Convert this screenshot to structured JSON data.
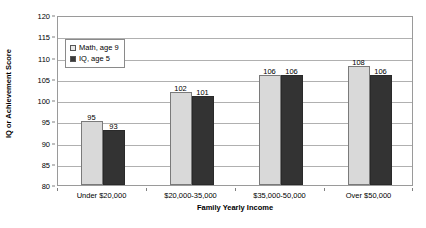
{
  "chart_data": {
    "type": "bar",
    "title": "",
    "subtitle": "",
    "xlabel": "Family Yearly Income",
    "ylabel": "IQ or Achievement Score",
    "categories": [
      "Under $20,000",
      "$20,000-35,000",
      "$35,000-50,000",
      "Over $50,000"
    ],
    "series": [
      {
        "name": "Math, age 9",
        "color": "#D9D9D9",
        "values": [
          95,
          102,
          106,
          108
        ]
      },
      {
        "name": "IQ, age 5",
        "color": "#333333",
        "values": [
          93,
          101,
          106,
          106
        ]
      }
    ],
    "ylim": [
      80,
      120
    ],
    "y_ticks": [
      80,
      85,
      90,
      95,
      100,
      105,
      110,
      115,
      120
    ],
    "y_tick_labels": [
      "80",
      "85",
      "90",
      "95",
      "100",
      "105",
      "110",
      "115",
      "120"
    ],
    "grid": "horizontal",
    "legend_position": "top-left-inside",
    "data_labels": true,
    "plot_border_color": "#9A9A9A",
    "gridline_color": "#B0B0B0",
    "background_color": "#FFFFFF"
  },
  "legend": {
    "entries": [
      {
        "label": "Math, age 9",
        "swatch": "light-gray-square"
      },
      {
        "label": "IQ, age 5",
        "swatch": "dark-gray-square"
      }
    ]
  },
  "axes": {
    "y_title": "IQ or Achievement Score",
    "x_title": "Family Yearly Income"
  }
}
